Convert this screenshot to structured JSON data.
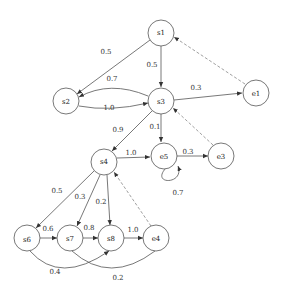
{
  "diagram": {
    "type": "state-transition-graph",
    "nodes": [
      {
        "id": "s1",
        "label": "s1",
        "x": 161,
        "y": 33
      },
      {
        "id": "s2",
        "label": "s2",
        "x": 66,
        "y": 101
      },
      {
        "id": "s3",
        "label": "s3",
        "x": 161,
        "y": 101
      },
      {
        "id": "e1",
        "label": "e1",
        "x": 256,
        "y": 93
      },
      {
        "id": "s4",
        "label": "s4",
        "x": 104,
        "y": 162
      },
      {
        "id": "e5",
        "label": "e5",
        "x": 164,
        "y": 156
      },
      {
        "id": "e3",
        "label": "e3",
        "x": 221,
        "y": 156
      },
      {
        "id": "s6",
        "label": "s6",
        "x": 27,
        "y": 238
      },
      {
        "id": "s7",
        "label": "s7",
        "x": 70,
        "y": 238
      },
      {
        "id": "s8",
        "label": "s8",
        "x": 111,
        "y": 238
      },
      {
        "id": "e4",
        "label": "e4",
        "x": 156,
        "y": 238
      }
    ],
    "edges": [
      {
        "from": "s1",
        "to": "s2",
        "label": "0.5",
        "style": "solid"
      },
      {
        "from": "s1",
        "to": "s3",
        "label": "0.5",
        "style": "solid"
      },
      {
        "from": "s3",
        "to": "s2",
        "label": "0.7",
        "style": "solid"
      },
      {
        "from": "s2",
        "to": "s3",
        "label": "1.0",
        "style": "solid"
      },
      {
        "from": "s3",
        "to": "e1",
        "label": "0.3",
        "style": "solid"
      },
      {
        "from": "e1",
        "to": "s1",
        "label": "",
        "style": "dashed"
      },
      {
        "from": "s3",
        "to": "s4",
        "label": "0.9",
        "style": "solid"
      },
      {
        "from": "s3",
        "to": "e5",
        "label": "0.1",
        "style": "solid"
      },
      {
        "from": "e3",
        "to": "s3",
        "label": "",
        "style": "dashed"
      },
      {
        "from": "s4",
        "to": "e5",
        "label": "1.0",
        "style": "solid"
      },
      {
        "from": "e5",
        "to": "e3",
        "label": "0.3",
        "style": "solid"
      },
      {
        "from": "e5",
        "to": "e5",
        "label": "0.7",
        "style": "solid"
      },
      {
        "from": "s4",
        "to": "s6",
        "label": "0.5",
        "style": "solid"
      },
      {
        "from": "s4",
        "to": "s7",
        "label": "0.3",
        "style": "solid"
      },
      {
        "from": "s4",
        "to": "s8",
        "label": "0.2",
        "style": "solid"
      },
      {
        "from": "e4",
        "to": "s4",
        "label": "",
        "style": "dashed"
      },
      {
        "from": "s6",
        "to": "s7",
        "label": "0.6",
        "style": "solid"
      },
      {
        "from": "s7",
        "to": "s8",
        "label": "0.8",
        "style": "solid"
      },
      {
        "from": "s8",
        "to": "e4",
        "label": "1.0",
        "style": "solid"
      },
      {
        "from": "s6",
        "to": "s8",
        "label": "0.4",
        "style": "solid"
      },
      {
        "from": "s7",
        "to": "e4",
        "label": "0.2",
        "style": "solid"
      }
    ]
  },
  "labels": {
    "s1_s2": "0.5",
    "s1_s3": "0.5",
    "s3_s2": "0.7",
    "s2_s3": "1.0",
    "s3_e1": "0.3",
    "s3_s4": "0.9",
    "s3_e5": "0.1",
    "s4_e5": "1.0",
    "e5_e3": "0.3",
    "e5_loop": "0.7",
    "s4_s6": "0.5",
    "s4_s7": "0.3",
    "s4_s8": "0.2",
    "s6_s7": "0.6",
    "s7_s8": "0.8",
    "s8_e4": "1.0",
    "s6_s8": "0.4",
    "s7_e4": "0.2"
  },
  "nodes": {
    "s1": "s1",
    "s2": "s2",
    "s3": "s3",
    "e1": "e1",
    "s4": "s4",
    "e5": "e5",
    "e3": "e3",
    "s6": "s6",
    "s7": "s7",
    "s8": "s8",
    "e4": "e4"
  }
}
